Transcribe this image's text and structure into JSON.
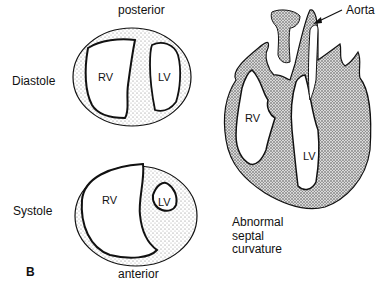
{
  "figure": {
    "panel_label": "B",
    "orientation": {
      "top": "posterior",
      "bottom": "anterior"
    },
    "phases": [
      {
        "label": "Diastole",
        "chambers": [
          "RV",
          "LV"
        ]
      },
      {
        "label": "Systole",
        "chambers": [
          "RV",
          "LV"
        ]
      }
    ],
    "long_axis": {
      "chambers": [
        "RV",
        "LV"
      ],
      "arrow_label": "Aorta",
      "caption_lines": [
        "Abnormal",
        "septal",
        "curvature"
      ]
    }
  },
  "colors": {
    "ink": "#111111",
    "stipple": "#8a8a8a",
    "background": "#ffffff"
  }
}
